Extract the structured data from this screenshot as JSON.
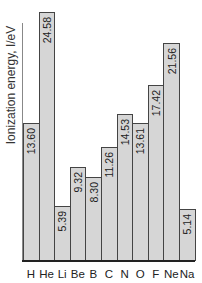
{
  "chart_data": {
    "type": "bar",
    "title": "",
    "xlabel": "",
    "ylabel": "Ionization energy, I/eV",
    "categories": [
      "H",
      "He",
      "Li",
      "Be",
      "B",
      "C",
      "N",
      "O",
      "F",
      "Ne",
      "Na"
    ],
    "values": [
      13.6,
      24.58,
      5.39,
      9.32,
      8.3,
      11.26,
      14.53,
      13.61,
      17.42,
      21.56,
      5.14
    ],
    "value_labels": [
      "13.60",
      "24.58",
      "5.39",
      "9.32",
      "8.30",
      "11.26",
      "14.53",
      "13.61",
      "17.42",
      "21.56",
      "5.14"
    ],
    "ylim": [
      0,
      25
    ],
    "grid": false,
    "legend": null,
    "colors": {
      "bar_fill": "#d6d6d6",
      "bar_edge": "#444444",
      "axis": "#222222"
    }
  }
}
